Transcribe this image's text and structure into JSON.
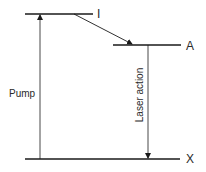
{
  "diagram": {
    "type": "energy-level-diagram",
    "levels": [
      {
        "id": "I",
        "label": "I"
      },
      {
        "id": "A",
        "label": "A"
      },
      {
        "id": "X",
        "label": "X"
      }
    ],
    "transitions": [
      {
        "from": "X",
        "to": "I",
        "label": "Pump"
      },
      {
        "from": "I",
        "to": "A",
        "label": ""
      },
      {
        "from": "A",
        "to": "X",
        "label": "Laser action"
      }
    ],
    "colors": {
      "line": "#1a1a1a",
      "text": "#2a2a2a",
      "background": "#ffffff"
    }
  }
}
